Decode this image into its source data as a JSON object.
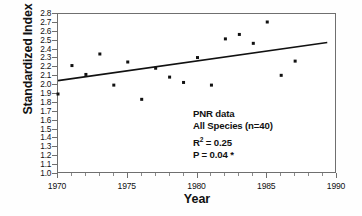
{
  "chart_data": {
    "type": "scatter",
    "title": "",
    "xlabel": "Year",
    "ylabel": "Standardized Index",
    "xlim": [
      1970,
      1990
    ],
    "ylim": [
      1.0,
      2.8
    ],
    "grid": false,
    "legend": "none",
    "x_major_ticks": [
      1970,
      1975,
      1980,
      1985,
      1990
    ],
    "x_tick_labels": [
      "1970",
      "1975",
      "1980",
      "1985",
      "1990"
    ],
    "x_minor_step": 1,
    "y_ticks": [
      1.0,
      1.1,
      1.2,
      1.3,
      1.4,
      1.5,
      1.6,
      1.7,
      1.8,
      1.9,
      2.0,
      2.1,
      2.2,
      2.3,
      2.4,
      2.5,
      2.6,
      2.7,
      2.8
    ],
    "y_tick_labels": [
      "1.0",
      "1.1",
      "1.2",
      "1.3",
      "1.4",
      "1.5",
      "1.6",
      "1.7",
      "1.8",
      "1.9",
      "2.0",
      "2.1",
      "2.2",
      "2.3",
      "2.4",
      "2.5",
      "2.6",
      "2.7",
      "2.8"
    ],
    "marker": "filled-square",
    "marker_color": "#111111",
    "points": [
      {
        "x": 1970,
        "y": 1.9
      },
      {
        "x": 1971,
        "y": 2.22
      },
      {
        "x": 1972,
        "y": 2.12
      },
      {
        "x": 1973,
        "y": 2.35
      },
      {
        "x": 1974,
        "y": 2.0
      },
      {
        "x": 1975,
        "y": 2.26
      },
      {
        "x": 1976,
        "y": 1.84
      },
      {
        "x": 1977,
        "y": 2.19
      },
      {
        "x": 1978,
        "y": 2.09
      },
      {
        "x": 1979,
        "y": 2.03
      },
      {
        "x": 1980,
        "y": 2.31
      },
      {
        "x": 1981,
        "y": 2.0
      },
      {
        "x": 1982,
        "y": 2.52
      },
      {
        "x": 1983,
        "y": 2.57
      },
      {
        "x": 1984,
        "y": 2.47
      },
      {
        "x": 1985,
        "y": 2.71
      },
      {
        "x": 1986,
        "y": 2.11
      },
      {
        "x": 1987,
        "y": 2.27
      }
    ],
    "trendline": {
      "type": "linear-regression",
      "x_start": 1970,
      "y_start": 2.05,
      "x_end": 1989.3,
      "y_end": 2.48,
      "color": "#111111",
      "width": 1.6
    }
  },
  "annotation": {
    "line1": "PNR data",
    "line2": "All Species (n=40)",
    "r2_prefix": "R",
    "r2_exp": "2",
    "r2_value": " = 0.25",
    "p_value": "P = 0.04 *"
  }
}
